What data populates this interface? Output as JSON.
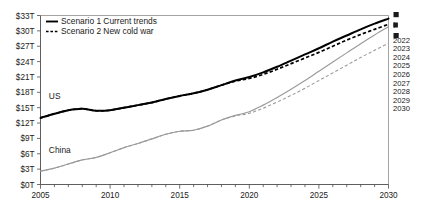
{
  "chart_data": {
    "type": "line",
    "title": "",
    "xlabel": "",
    "ylabel": "",
    "xlim": [
      2005,
      2030
    ],
    "ylim": [
      0,
      33
    ],
    "grid": false,
    "legend_position": "top-left",
    "y_unit": "trillions of US dollars",
    "x_tick_labels": [
      "2005",
      "2010",
      "2015",
      "2020",
      "2025",
      "2030"
    ],
    "x_ticks": [
      2005,
      2010,
      2015,
      2020,
      2025,
      2030
    ],
    "x_minor_tick_interval": 1,
    "y_tick_labels": [
      "$0T",
      "$3T",
      "$6T",
      "$9T",
      "$12T",
      "$15T",
      "$18T",
      "$21T",
      "$24T",
      "$27T",
      "$30T",
      "$33T"
    ],
    "y_ticks": [
      0,
      3,
      6,
      9,
      12,
      15,
      18,
      21,
      24,
      27,
      30,
      33
    ],
    "x": [
      2005,
      2006,
      2007,
      2008,
      2009,
      2010,
      2011,
      2012,
      2013,
      2014,
      2015,
      2016,
      2017,
      2018,
      2019,
      2020,
      2021,
      2022,
      2023,
      2024,
      2025,
      2026,
      2027,
      2028,
      2029,
      2030
    ],
    "series": [
      {
        "name": "US",
        "scenario": "Scenario 1 Current trends",
        "style": "solid",
        "color": "#000000",
        "values": [
          13.0,
          13.8,
          14.5,
          14.8,
          14.4,
          14.5,
          15.0,
          15.5,
          16.0,
          16.7,
          17.3,
          17.8,
          18.5,
          19.4,
          20.3,
          21.0,
          21.9,
          23.0,
          24.2,
          25.4,
          26.6,
          27.9,
          29.1,
          30.3,
          31.4,
          32.4
        ]
      },
      {
        "name": "US",
        "scenario": "Scenario 2 New cold war",
        "style": "dashed",
        "color": "#000000",
        "values": [
          13.0,
          13.8,
          14.5,
          14.8,
          14.4,
          14.5,
          15.0,
          15.5,
          16.0,
          16.7,
          17.3,
          17.8,
          18.5,
          19.4,
          20.2,
          20.7,
          21.5,
          22.5,
          23.6,
          24.7,
          25.8,
          27.0,
          28.2,
          29.3,
          30.3,
          31.3
        ]
      },
      {
        "name": "China",
        "scenario": "Scenario 1 Current trends",
        "style": "solid",
        "color": "#9a9a9a",
        "values": [
          2.6,
          3.2,
          4.0,
          4.8,
          5.3,
          6.2,
          7.2,
          8.0,
          8.9,
          9.8,
          10.4,
          10.6,
          11.4,
          12.6,
          13.5,
          14.2,
          15.5,
          17.0,
          18.6,
          20.3,
          22.1,
          23.9,
          25.7,
          27.5,
          29.2,
          30.8
        ]
      },
      {
        "name": "China",
        "scenario": "Scenario 2 New cold war",
        "style": "dashed",
        "color": "#9a9a9a",
        "values": [
          2.6,
          3.2,
          4.0,
          4.8,
          5.3,
          6.2,
          7.2,
          8.0,
          8.9,
          9.8,
          10.4,
          10.6,
          11.4,
          12.6,
          13.4,
          13.9,
          14.9,
          16.1,
          17.4,
          18.8,
          20.3,
          21.8,
          23.3,
          24.8,
          26.2,
          27.6
        ]
      }
    ],
    "annotations": [
      {
        "text": "US",
        "x": 2005.6,
        "y": 16.6
      },
      {
        "text": "China",
        "x": 2005.6,
        "y": 6.2
      }
    ],
    "legend": [
      {
        "label": "Scenario 1 Current trends",
        "style": "solid"
      },
      {
        "label": "Scenario 2 New cold war",
        "style": "dashed"
      }
    ],
    "right_axis_years": [
      "2022",
      "2023",
      "2024",
      "2025",
      "2026",
      "2027",
      "2028",
      "2029",
      "2030"
    ],
    "right_axis_clipped_marks": 3
  }
}
